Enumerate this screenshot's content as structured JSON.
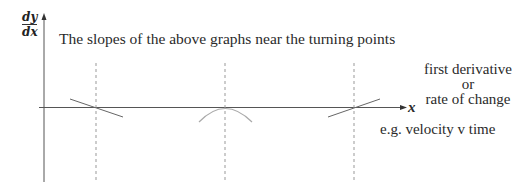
{
  "diagram": {
    "title": "The slopes of the above graphs near the turning points",
    "y_axis_label": {
      "numerator": "dy",
      "denominator": "dx"
    },
    "x_axis_label": "x",
    "side_label": {
      "line1": "first derivative",
      "line2": "or",
      "line3": "rate of change"
    },
    "example": "e.g. velocity v time",
    "turning_points": [
      {
        "x": 96,
        "slope": "negative"
      },
      {
        "x": 225,
        "slope": "zero (curve maximum)"
      },
      {
        "x": 354,
        "slope": "positive"
      }
    ],
    "colors": {
      "axis": "#555555",
      "line": "#666666",
      "curve": "#aaaaaa",
      "dash": "#999999"
    }
  }
}
